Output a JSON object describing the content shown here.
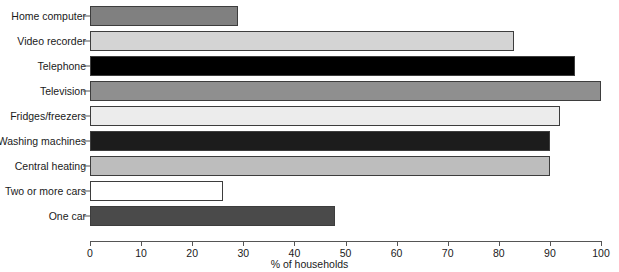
{
  "chart_data": {
    "type": "bar",
    "orientation": "horizontal",
    "title": "",
    "xlabel": "% of households",
    "ylabel": "",
    "xlim": [
      0,
      100
    ],
    "xticks": [
      0,
      10,
      20,
      30,
      40,
      50,
      60,
      70,
      80,
      90,
      100
    ],
    "xtick_labels": [
      "0",
      "10",
      "20",
      "30",
      "40",
      "50",
      "60",
      "70",
      "80",
      "90",
      "100"
    ],
    "grid": false,
    "legend": "none",
    "categories": [
      "Home computer",
      "Video recorder",
      "Telephone",
      "Television",
      "Fridges/freezers",
      "Washing machines",
      "Central heating",
      "Two or more cars",
      "One car"
    ],
    "values": [
      29,
      83,
      95,
      100,
      92,
      90,
      90,
      26,
      48
    ],
    "bar_colors": [
      "#808080",
      "#d4d4d4",
      "#000000",
      "#8f8f8f",
      "#ececec",
      "#1c1c1c",
      "#bdbdbd",
      "#ffffff",
      "#4a4a4a"
    ],
    "bar_border_color": "#3d3d3d"
  }
}
